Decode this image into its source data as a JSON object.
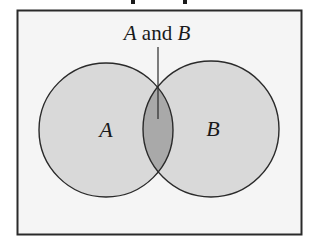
{
  "title_fragment": {
    "descender_x": [
      133,
      185
    ]
  },
  "diagram": {
    "type": "venn",
    "frame": {
      "x": 17,
      "y": 10,
      "width": 284,
      "height": 224,
      "background": "#f5f5f5",
      "border": "#2a2a2a"
    },
    "sets": [
      {
        "label": "A",
        "cx": 106,
        "cy": 130,
        "r": 67,
        "fill": "#d9d9d9"
      },
      {
        "label": "B",
        "cx": 211,
        "cy": 129,
        "r": 68,
        "fill": "#d9d9d9"
      }
    ],
    "intersection": {
      "label": "A and B",
      "fill": "#a9a9a9"
    },
    "annotation": {
      "text_part1": "A",
      "text_part2": " and ",
      "text_part3": "B",
      "pointer": {
        "x": 158,
        "y1": 47,
        "y2": 119
      }
    },
    "stroke": "#2a2a2a"
  }
}
